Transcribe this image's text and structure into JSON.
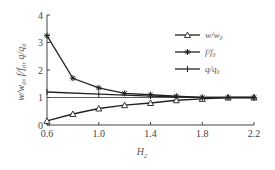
{
  "chart_data": {
    "type": "line",
    "title": "",
    "xlabel": "H_2",
    "ylabel": "w/w_0, f/f_0, q/q_0",
    "xlim": [
      0.6,
      2.2
    ],
    "ylim": [
      0,
      4
    ],
    "xticks": [
      0.6,
      1.0,
      1.4,
      1.8,
      2.2
    ],
    "yticks": [
      0,
      1,
      2,
      3,
      4
    ],
    "reference_line_y": 1,
    "grid": false,
    "legend_position": "upper right",
    "series": [
      {
        "name": "w/w_0",
        "marker": "triangle-open",
        "x": [
          0.6,
          0.8,
          1.0,
          1.2,
          1.4,
          1.6,
          1.8,
          2.0,
          2.2
        ],
        "values": [
          0.15,
          0.4,
          0.6,
          0.72,
          0.8,
          0.9,
          0.95,
          1.0,
          1.0
        ]
      },
      {
        "name": "f/f_0",
        "marker": "star",
        "x": [
          0.6,
          0.8,
          1.0,
          1.2,
          1.4,
          1.6,
          1.8,
          2.0,
          2.2
        ],
        "values": [
          3.25,
          1.7,
          1.35,
          1.15,
          1.1,
          1.05,
          1.0,
          1.0,
          1.0
        ]
      },
      {
        "name": "q/q_0",
        "marker": "plus",
        "x": [
          0.6,
          1.0,
          1.4,
          1.8,
          2.2
        ],
        "values": [
          1.2,
          1.12,
          1.05,
          1.0,
          1.0
        ]
      }
    ]
  },
  "axis": {
    "x_label_main": "H",
    "x_label_sub": "2",
    "y_label_text": "w/w₀, f/f₀, q/q₀",
    "x_tick_labels": [
      "0.6",
      "1.0",
      "1.4",
      "1.8",
      "2.2"
    ],
    "y_tick_labels": [
      "0",
      "1",
      "2",
      "3",
      "4"
    ]
  },
  "legend": {
    "items": [
      {
        "label": "w/w₀"
      },
      {
        "label": "f/f₀"
      },
      {
        "label": "q/q₀"
      }
    ]
  },
  "colors": {
    "line": "#222222",
    "axis": "#444444",
    "text": "#555555"
  }
}
